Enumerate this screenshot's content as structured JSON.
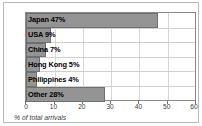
{
  "chart_data": {
    "type": "bar",
    "orientation": "horizontal",
    "title": "",
    "xlabel": "% of total arrivals",
    "ylabel": "",
    "xlim": [
      0,
      60
    ],
    "xticks": [
      0,
      10,
      20,
      30,
      40,
      50,
      60
    ],
    "xtick_labels": [
      "0",
      "10",
      "20",
      "30",
      "40",
      "50",
      "60"
    ],
    "grid": true,
    "grid_axis": "both",
    "legend": false,
    "bar_color": "#949494",
    "bar_edge_color": "#6f6f6f",
    "categories": [
      "Japan",
      "USA",
      "China",
      "Hong Kong",
      "Philippines",
      "Other"
    ],
    "values": [
      47,
      9,
      7,
      5,
      4,
      28
    ],
    "labels": [
      "Japan 47%",
      "USA 9%",
      "China 7%",
      "Hong Kong 5%",
      "Philippines 4%",
      "Other 28%"
    ]
  }
}
